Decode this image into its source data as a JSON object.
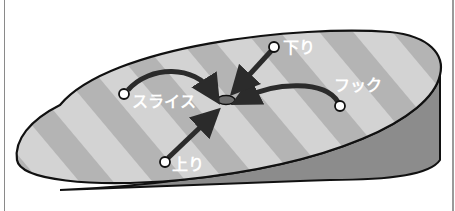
{
  "diagram": {
    "labels": {
      "slice": "スライス",
      "hook": "フック",
      "downhill": "下り",
      "uphill": "上り"
    },
    "colors": {
      "stripe_light": "#d3d3d3",
      "stripe_dark": "#b4b4b4",
      "wall": "#8c8c8c",
      "outline": "#111111",
      "arrow": "#2b2b2b",
      "hole": "#6e6e6e",
      "ball": "#ffffff",
      "label": "#ffffff",
      "frame": "#8a8a8a"
    }
  }
}
